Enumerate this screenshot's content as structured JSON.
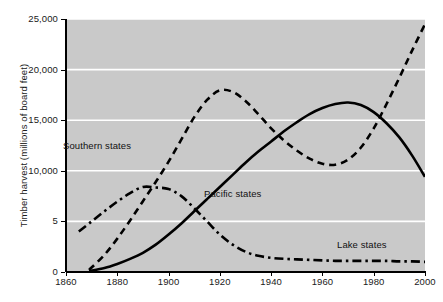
{
  "chart_data": {
    "type": "line",
    "title": "",
    "xlabel": "",
    "ylabel": "Timber harvest (millions of board feet)",
    "xlim": [
      1860,
      2000
    ],
    "ylim": [
      0,
      25000
    ],
    "grid": true,
    "legend_position": "inline-annotations",
    "background_color": "#c9c9c9",
    "line_color": "#000000",
    "xticks": [
      1860,
      1880,
      1900,
      1920,
      1940,
      1960,
      1980,
      2000
    ],
    "xtick_labels": [
      "1860",
      "1880",
      "1900",
      "1920",
      "1940",
      "1960",
      "1980",
      "2000"
    ],
    "yticks": [
      0,
      5000,
      10000,
      15000,
      20000,
      25000
    ],
    "ytick_labels": [
      "0",
      "5",
      "10,000",
      "15,000",
      "20,000",
      "25,000"
    ],
    "series": [
      {
        "name": "Southern states",
        "style": "dashed",
        "x": [
          1869,
          1875,
          1880,
          1885,
          1890,
          1895,
          1900,
          1905,
          1910,
          1915,
          1920,
          1925,
          1930,
          1935,
          1940,
          1945,
          1950,
          1955,
          1960,
          1965,
          1970,
          1975,
          1980,
          1985,
          1990,
          1995,
          2000
        ],
        "values": [
          200,
          1700,
          3300,
          5100,
          7000,
          8900,
          10900,
          13100,
          15300,
          17000,
          17950,
          17800,
          16900,
          15600,
          14200,
          13000,
          12000,
          11200,
          10700,
          10600,
          11100,
          12300,
          14200,
          16600,
          19200,
          21900,
          24500
        ]
      },
      {
        "name": "Pacific states",
        "style": "solid",
        "x": [
          1869,
          1875,
          1880,
          1885,
          1890,
          1895,
          1900,
          1905,
          1910,
          1915,
          1920,
          1925,
          1930,
          1935,
          1940,
          1945,
          1950,
          1955,
          1960,
          1965,
          1970,
          1975,
          1980,
          1985,
          1990,
          1995,
          2000
        ],
        "values": [
          100,
          400,
          800,
          1300,
          1900,
          2700,
          3700,
          4800,
          6000,
          7200,
          8400,
          9600,
          10800,
          11900,
          12900,
          13900,
          14800,
          15600,
          16200,
          16600,
          16750,
          16500,
          15800,
          14700,
          13300,
          11500,
          9400
        ]
      },
      {
        "name": "Lake states",
        "style": "dash-dot",
        "x": [
          1865,
          1870,
          1875,
          1880,
          1885,
          1890,
          1895,
          1900,
          1905,
          1910,
          1915,
          1920,
          1925,
          1930,
          1935,
          1940,
          1945,
          1950,
          1955,
          1960,
          1965,
          1970,
          1975,
          1980,
          1985,
          1990,
          1995,
          2000
        ],
        "values": [
          4000,
          5000,
          6000,
          6950,
          7800,
          8400,
          8350,
          8200,
          7500,
          6300,
          5000,
          3700,
          2700,
          2000,
          1600,
          1400,
          1300,
          1250,
          1200,
          1150,
          1100,
          1100,
          1100,
          1100,
          1100,
          1050,
          1050,
          1000
        ]
      }
    ],
    "annotations": [
      {
        "text": "Southern states",
        "x": 1863,
        "y": 13900
      },
      {
        "text": "Pacific states",
        "x": 1918,
        "y": 8900
      },
      {
        "text": "Lake states",
        "x": 1970,
        "y": 3900
      }
    ]
  }
}
